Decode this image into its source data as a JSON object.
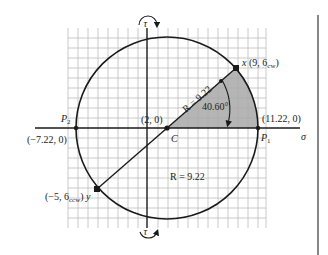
{
  "diagram": {
    "type": "mohr-circle",
    "axes": {
      "horizontal_label": "σ",
      "vertical_label": "τ"
    },
    "center": {
      "label": "C",
      "coords": "(2, 0)"
    },
    "points": {
      "x": {
        "label": "x",
        "coords": "(9, 6",
        "sub": "cw",
        "close": ")"
      },
      "y": {
        "label": "y",
        "coords": "(−5, 6",
        "sub": "ccw",
        "close": ")"
      },
      "p1": {
        "label": "P",
        "sub": "1",
        "coords": "(11.22, 0)"
      },
      "p2": {
        "label": "P",
        "sub": "2",
        "coords": "(−7.22, 0)"
      }
    },
    "radius_label_diag": "R = 9.22",
    "radius_label_lower": "R = 9.22",
    "angle_label": "40.60°",
    "colors": {
      "line": "#1a1a1a",
      "grid": "#b8b8b8",
      "shade": "#a8a8a8",
      "divider": "#555555"
    }
  }
}
